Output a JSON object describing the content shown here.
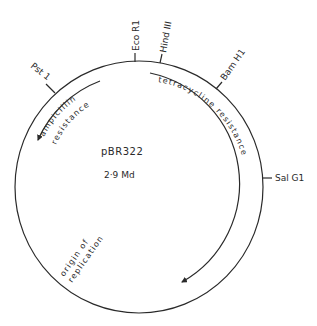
{
  "plasmid": {
    "name": "pBR322",
    "size": "2·9 Md"
  },
  "restriction_sites": [
    {
      "label": "Pst 1",
      "key": "pst1"
    },
    {
      "label": "Eco R1",
      "key": "ecor1"
    },
    {
      "label": "Hind III",
      "key": "hindiii"
    },
    {
      "label": "Bam H1",
      "key": "bamh1"
    },
    {
      "label": "Sal G1",
      "key": "salg1"
    }
  ],
  "genes": [
    {
      "label": "ampicillin",
      "key": "amp-line1"
    },
    {
      "label": "resistance",
      "key": "amp-line2"
    },
    {
      "label": "tetracycline resistance",
      "key": "tet"
    }
  ],
  "origin": {
    "line1": "origin of",
    "line2": "replication"
  },
  "colors": {
    "ink": "#2a2a2a",
    "background": "#ffffff"
  }
}
